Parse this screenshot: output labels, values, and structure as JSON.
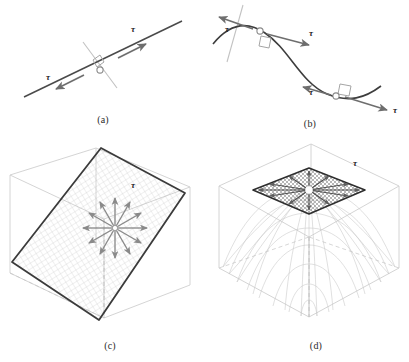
{
  "figure": {
    "background_color": "#ffffff",
    "symbol_tau": "τ",
    "colors": {
      "curve_dark": "#3a3a3a",
      "arrow_gray": "#7a7a7a",
      "normal_line_gray": "#b9b9b9",
      "box_wire_gray": "#c9c9c9",
      "mesh_gray": "#a8a8a8",
      "plane_border": "#2f2f2f",
      "label_text": "#242424",
      "caption_text": "#2b2b2b"
    }
  },
  "panels": [
    {
      "id": "a",
      "caption": "(a)",
      "description": "straight-line-with-tangent-vectors",
      "object_type": "line",
      "tangent_points": 1,
      "tau_labels": [
        {
          "text": "τ",
          "position": "upper-right"
        },
        {
          "text": "τ",
          "position": "lower-left"
        }
      ],
      "arrow_count": 2,
      "has_right_angle_marker": true,
      "has_normal_line": true
    },
    {
      "id": "b",
      "caption": "(b)",
      "description": "s-curve-with-two-tangent-points",
      "object_type": "curve",
      "tangent_points": 2,
      "tau_labels": [
        {
          "text": "τ",
          "position": "upper-left"
        },
        {
          "text": "τ",
          "position": "upper-middle-right"
        },
        {
          "text": "τ",
          "position": "lower-middle-left"
        },
        {
          "text": "τ",
          "position": "lower-right"
        }
      ],
      "arrow_count": 4,
      "has_right_angle_marker": true,
      "has_normal_line": true
    },
    {
      "id": "c",
      "caption": "(c)",
      "description": "tilted-tangent-plane-in-wireframe-box",
      "object_type": "plane",
      "tangent_points": 1,
      "tau_labels": [
        {
          "text": "τ",
          "position": "above-arrow-fan"
        }
      ],
      "arrow_count": 12,
      "arrow_fan_degrees": 30,
      "has_wireframe_box": true,
      "has_dashed_axis": true,
      "has_mesh": true
    },
    {
      "id": "d",
      "caption": "(d)",
      "description": "paraboloid-dome-with-tangent-plane-at-apex",
      "object_type": "surface",
      "tangent_points": 1,
      "tau_labels": [
        {
          "text": "τ",
          "position": "upper-right-of-plane"
        }
      ],
      "arrow_count": 12,
      "arrow_fan_degrees": 30,
      "has_wireframe_box": true,
      "has_dashed_axis": true,
      "has_mesh": true
    }
  ]
}
